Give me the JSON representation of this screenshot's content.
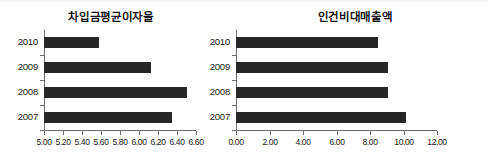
{
  "figure": {
    "background_color": "#ffffff",
    "bar_color": "#262626",
    "axis_color": "#6d6d6d"
  },
  "chart_data": [
    {
      "type": "bar",
      "orientation": "horizontal",
      "title": "차입금평균이자율",
      "categories": [
        "2010",
        "2009",
        "2008",
        "2007"
      ],
      "values": [
        5.58,
        6.13,
        6.5,
        6.35
      ],
      "xlabel": "",
      "ylabel": "",
      "xlim": [
        5.0,
        6.6
      ],
      "xticks": [
        5.0,
        5.2,
        5.4,
        5.6,
        5.8,
        6.0,
        6.2,
        6.4,
        6.6
      ],
      "xtick_labels": [
        "5.00",
        "5.20",
        "5.40",
        "5.60",
        "5.80",
        "6.00",
        "6.20",
        "6.40",
        "6.60"
      ],
      "grid": false,
      "legend": false
    },
    {
      "type": "bar",
      "orientation": "horizontal",
      "title": "인건비대매출액",
      "categories": [
        "2010",
        "2009",
        "2008",
        "2007"
      ],
      "values": [
        8.45,
        9.05,
        9.1,
        10.15
      ],
      "xlabel": "",
      "ylabel": "",
      "xlim": [
        0.0,
        12.0
      ],
      "xticks": [
        0.0,
        2.0,
        4.0,
        6.0,
        8.0,
        10.0,
        12.0
      ],
      "xtick_labels": [
        "0.00",
        "2.00",
        "4.00",
        "6.00",
        "8.00",
        "10.00",
        "12.00"
      ],
      "grid": false,
      "legend": false
    }
  ]
}
